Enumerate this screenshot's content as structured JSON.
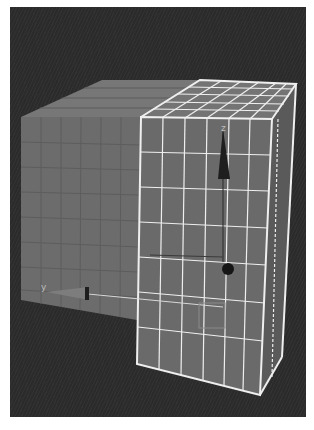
{
  "viewport": {
    "background": "#2b2b2b",
    "object": {
      "name": "cube",
      "face_color": "#6e6e6e",
      "top_color": "#767676",
      "selected_wire_color": "#f2f2f2",
      "grid_divisions": 8
    },
    "gizmo": {
      "z_axis_label": "z",
      "y_axis_label": "y",
      "arrow_color": "#1e1e1e",
      "pivot_color": "#151515"
    }
  }
}
